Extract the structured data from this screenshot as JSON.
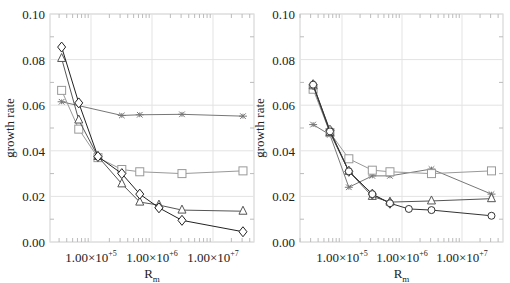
{
  "chart_data": [
    {
      "type": "line",
      "panel": "left",
      "title": "",
      "xlabel": "R_m",
      "ylabel": "growth rate",
      "xscale": "log",
      "xlim": [
        20000.0,
        45000000.0
      ],
      "ylim": [
        0.0,
        0.1
      ],
      "grid": true,
      "x_ticks": [
        100000.0,
        1000000.0,
        10000000.0
      ],
      "x_tick_labels": [
        "1.00×10+5",
        "1.00×10+6",
        "1.00×10+7"
      ],
      "y_ticks": [
        0.0,
        0.02,
        0.04,
        0.06,
        0.08,
        0.1
      ],
      "y_tick_labels": [
        "0.00",
        "0.02",
        "0.04",
        "0.06",
        "0.08",
        "0.10"
      ],
      "series": [
        {
          "name": "asterisk",
          "marker": "asterisk",
          "color": "#777777",
          "x": [
            33000.0,
            320000.0,
            630000.0,
            3100000.0,
            31000000.0
          ],
          "values": [
            0.0615,
            0.0555,
            0.0558,
            0.056,
            0.0552
          ]
        },
        {
          "name": "square",
          "marker": "square",
          "color": "#999999",
          "x": [
            33000.0,
            63000.0,
            130000.0,
            320000.0,
            630000.0,
            3100000.0,
            31000000.0
          ],
          "values": [
            0.0665,
            0.0495,
            0.037,
            0.0318,
            0.0308,
            0.03,
            0.0312
          ]
        },
        {
          "name": "triangle",
          "marker": "triangle",
          "color": "#555555",
          "x": [
            33000.0,
            63000.0,
            130000.0,
            320000.0,
            630000.0,
            1300000.0,
            3100000.0,
            31000000.0
          ],
          "values": [
            0.0805,
            0.0535,
            0.0375,
            0.0255,
            0.0175,
            0.0162,
            0.014,
            0.0135
          ]
        },
        {
          "name": "diamond",
          "marker": "diamond",
          "color": "#222222",
          "x": [
            33000.0,
            63000.0,
            130000.0,
            320000.0,
            630000.0,
            1300000.0,
            3100000.0,
            31000000.0
          ],
          "values": [
            0.0855,
            0.061,
            0.0375,
            0.03,
            0.021,
            0.015,
            0.0095,
            0.0045
          ]
        }
      ]
    },
    {
      "type": "line",
      "panel": "right",
      "title": "",
      "xlabel": "R_m",
      "ylabel": "growth rate",
      "xscale": "log",
      "xlim": [
        20000.0,
        45000000.0
      ],
      "ylim": [
        0.0,
        0.1
      ],
      "grid": true,
      "x_ticks": [
        100000.0,
        1000000.0,
        10000000.0
      ],
      "x_tick_labels": [
        "1.00×10+5",
        "1.00×10+6",
        "1.00×10+7"
      ],
      "y_ticks": [
        0.0,
        0.02,
        0.04,
        0.06,
        0.08,
        0.1
      ],
      "y_tick_labels": [
        "0.00",
        "0.02",
        "0.04",
        "0.06",
        "0.08",
        "0.10"
      ],
      "series": [
        {
          "name": "asterisk",
          "marker": "asterisk",
          "color": "#777777",
          "x": [
            33000.0,
            63000.0,
            130000.0,
            320000.0,
            630000.0,
            3100000.0,
            31000000.0
          ],
          "values": [
            0.0515,
            0.047,
            0.024,
            0.029,
            0.029,
            0.032,
            0.021
          ]
        },
        {
          "name": "square",
          "marker": "square",
          "color": "#999999",
          "x": [
            33000.0,
            63000.0,
            130000.0,
            320000.0,
            630000.0,
            3100000.0,
            31000000.0
          ],
          "values": [
            0.067,
            0.048,
            0.0365,
            0.0315,
            0.0308,
            0.03,
            0.0312
          ]
        },
        {
          "name": "triangle",
          "marker": "triangle",
          "color": "#555555",
          "x": [
            33000.0,
            63000.0,
            130000.0,
            320000.0,
            630000.0,
            3100000.0,
            31000000.0
          ],
          "values": [
            0.0685,
            0.048,
            0.031,
            0.02,
            0.0175,
            0.018,
            0.019
          ]
        },
        {
          "name": "diamond",
          "marker": "diamond",
          "color": "#444444",
          "x": [
            33000.0,
            63000.0,
            130000.0,
            320000.0,
            630000.0
          ],
          "values": [
            0.069,
            0.049,
            0.031,
            0.021,
            0.017
          ]
        },
        {
          "name": "circle",
          "marker": "circle",
          "color": "#333333",
          "x": [
            33000.0,
            63000.0,
            130000.0,
            320000.0,
            630000.0,
            1300000.0,
            3100000.0,
            31000000.0
          ],
          "values": [
            0.069,
            0.0485,
            0.031,
            0.021,
            0.017,
            0.0145,
            0.014,
            0.0115
          ]
        }
      ]
    }
  ],
  "labels": {
    "y_axis_title": "growth rate",
    "x_axis_title_main": "R",
    "x_axis_title_sub": "m",
    "x_tick_mantissa": "1.00×10",
    "x_tick_exponents": [
      "+5",
      "+6",
      "+7"
    ]
  }
}
